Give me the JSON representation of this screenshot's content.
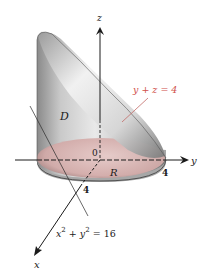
{
  "diagram": {
    "type": "3d-solid-region",
    "axes": {
      "z_label": "z",
      "y_label": "y",
      "x_label": "x",
      "origin_label": "0"
    },
    "ticks": {
      "x_tick": "4",
      "y_tick": "4"
    },
    "region_labels": {
      "solid": "D",
      "base": "R"
    },
    "equations": {
      "plane": "y + z = 4",
      "cylinder_base": "x",
      "cylinder_sup1": "2",
      "cylinder_mid": " + y",
      "cylinder_sup2": "2",
      "cylinder_rhs": " = 16"
    },
    "colors": {
      "plane_label": "#d0504a",
      "base_fill": "#d9b6b4",
      "base_edge": "#4a3a3a",
      "solid_dark": "#7d7d7d",
      "solid_light": "#ededed",
      "axis": "#1a1a1a",
      "background": "#ffffff"
    }
  }
}
